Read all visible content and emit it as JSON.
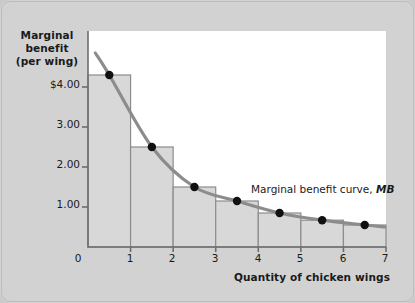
{
  "figure": {
    "background_color": "#d2d2d2",
    "plot_background_color": "#ffffff"
  },
  "chart_data": {
    "type": "bar",
    "title": "",
    "subtitle": "",
    "xlabel": "Quantity of chicken wings",
    "ylabel": "Marginal benefit (per wing)",
    "ylabel_lines": [
      "Marginal",
      "benefit",
      "(per wing)"
    ],
    "categories": [
      "1",
      "2",
      "3",
      "4",
      "5",
      "6",
      "7"
    ],
    "values": [
      4.3,
      2.5,
      1.5,
      1.15,
      0.85,
      0.67,
      0.55
    ],
    "bar_color": "#d8d8d8",
    "bar_edge_color": "#8c8c8c",
    "x": [
      0.5,
      1.5,
      2.5,
      3.5,
      4.5,
      5.5,
      6.5
    ],
    "series": [
      {
        "name": "Marginal benefit curve, MB",
        "type": "line",
        "color": "#8c8c8c",
        "marker_color": "#101010",
        "x": [
          0.5,
          1.5,
          2.5,
          3.5,
          4.5,
          5.5,
          6.5
        ],
        "values": [
          4.3,
          2.5,
          1.5,
          1.15,
          0.85,
          0.67,
          0.55
        ]
      }
    ],
    "annotations": [
      {
        "text": "Marginal benefit curve, MB",
        "text_plain": "Marginal benefit curve,",
        "text_italic": "MB",
        "x": 4.3,
        "y": 1.55
      }
    ],
    "xlim": [
      0,
      7
    ],
    "ylim": [
      0,
      5.4
    ],
    "xticks": [
      0,
      1,
      2,
      3,
      4,
      5,
      6,
      7
    ],
    "xtick_labels": [
      "0",
      "1",
      "2",
      "3",
      "4",
      "5",
      "6",
      "7"
    ],
    "yticks": [
      1.0,
      2.0,
      3.0,
      4.0
    ],
    "ytick_labels": [
      "1.00",
      "2.00",
      "3.00",
      "$4.00"
    ],
    "grid": false,
    "legend": "none",
    "axis_color": "#6e6e6e"
  }
}
